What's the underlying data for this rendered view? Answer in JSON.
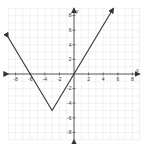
{
  "chart_data": {
    "type": "line",
    "title": "",
    "function": "y = (5/3)|x + 3| - 5",
    "xlabel": "x",
    "ylabel": "y",
    "xlim": [
      -9,
      9
    ],
    "ylim": [
      -9,
      9
    ],
    "grid": true,
    "x_ticks": [
      -8,
      -6,
      -4,
      -2,
      2,
      4,
      6,
      8
    ],
    "y_ticks": [
      -8,
      -6,
      -4,
      -2,
      2,
      4,
      6,
      8
    ],
    "series": [
      {
        "name": "absolute value graph",
        "x": [
          -9,
          -6,
          -3,
          0,
          5.4
        ],
        "y": [
          5,
          0,
          -5,
          0,
          9
        ]
      }
    ],
    "vertex": [
      -3,
      -5
    ],
    "x_intercepts": [
      -6,
      0
    ]
  },
  "labels": {
    "x_axis": "x",
    "y_axis": "y"
  }
}
